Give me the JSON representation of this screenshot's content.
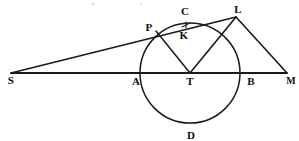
{
  "figure": {
    "kind": "geometry-diagram",
    "width": 299,
    "height": 141,
    "background_color": "#ffffff",
    "ink_color": "#1a1a1a"
  },
  "labels": {
    "S": "S",
    "A": "A",
    "T": "T",
    "B": "B",
    "M": "M",
    "P": "P",
    "C": "C",
    "K": "K",
    "L": "L",
    "D": "D"
  },
  "chart_data": {
    "type": "scatter",
    "title": "",
    "xlabel": "",
    "ylabel": "",
    "points": [
      {
        "name": "S",
        "x": 11,
        "y": 73,
        "label_x": 11,
        "label_y": 80
      },
      {
        "name": "A",
        "x": 140,
        "y": 73,
        "label_x": 136,
        "label_y": 81
      },
      {
        "name": "T",
        "x": 190,
        "y": 73,
        "label_x": 190,
        "label_y": 81
      },
      {
        "name": "B",
        "x": 240,
        "y": 73,
        "label_x": 251,
        "label_y": 81
      },
      {
        "name": "M",
        "x": 287,
        "y": 73,
        "label_x": 291,
        "label_y": 81
      },
      {
        "name": "P",
        "x": 156,
        "y": 31,
        "label_x": 149,
        "label_y": 27
      },
      {
        "name": "C",
        "x": 186,
        "y": 24,
        "label_x": 185,
        "label_y": 11
      },
      {
        "name": "K",
        "x": 186,
        "y": 26,
        "label_x": 184,
        "label_y": 35
      },
      {
        "name": "L",
        "x": 236,
        "y": 17,
        "label_x": 238,
        "label_y": 9
      },
      {
        "name": "D",
        "x": 190,
        "y": 123,
        "label_x": 191,
        "label_y": 135
      }
    ],
    "circle": {
      "center_x": 190,
      "center_y": 73,
      "radius": 50
    },
    "segments": [
      {
        "from": "S",
        "to": "M",
        "note": "baseline through A, T, B"
      },
      {
        "from": "S",
        "to": "L",
        "note": "straight line passing through P"
      },
      {
        "from": "P",
        "to": "T",
        "note": "radius to tangent point"
      },
      {
        "from": "L",
        "to": "T",
        "note": "radius-like chord to centre"
      },
      {
        "from": "L",
        "to": "M",
        "note": "closing side of triangle"
      }
    ]
  }
}
